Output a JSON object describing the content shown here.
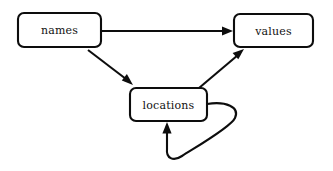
{
  "diagram": {
    "type": "directed-graph",
    "background_color": "#ffffff",
    "stroke_color": "#0d0d0d",
    "text_color": "#111111",
    "nodes": [
      {
        "id": "names",
        "label": "names",
        "shape": "rounded-rectangle",
        "x": 18,
        "y": 13,
        "width": 83,
        "height": 34,
        "corner_radius": 6
      },
      {
        "id": "values",
        "label": "values",
        "shape": "rounded-rectangle",
        "x": 234,
        "y": 14,
        "width": 79,
        "height": 33,
        "corner_radius": 6
      },
      {
        "id": "locations",
        "label": "locations",
        "shape": "rounded-rectangle",
        "x": 130,
        "y": 88,
        "width": 77,
        "height": 33,
        "corner_radius": 6
      }
    ],
    "edges": [
      {
        "id": "names-to-values",
        "from": "names",
        "to": "values",
        "style": "straight",
        "direction": "horizontal",
        "arrowhead": "filled-triangle"
      },
      {
        "id": "names-to-locations",
        "from": "names",
        "to": "locations",
        "style": "straight",
        "direction": "diagonal-down-right",
        "arrowhead": "filled-triangle"
      },
      {
        "id": "locations-to-values",
        "from": "locations",
        "to": "values",
        "style": "straight",
        "direction": "diagonal-up-right",
        "arrowhead": "filled-triangle"
      },
      {
        "id": "locations-self-loop",
        "from": "locations",
        "to": "locations",
        "style": "curved-self-loop",
        "direction": "right-down-left-up",
        "arrowhead": "filled-triangle"
      }
    ]
  }
}
